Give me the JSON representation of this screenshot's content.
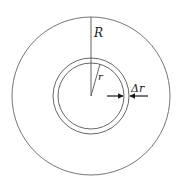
{
  "diagram": {
    "labels": {
      "outer_radius": "R",
      "inner_radius": "r",
      "thickness": "Δr"
    },
    "geometry": {
      "center": [
        91,
        96
      ],
      "outer_circle_radius": 79,
      "annulus_outer_radius": 38,
      "annulus_inner_radius": 33
    },
    "colors": {
      "stroke": "#555555",
      "arrow": "#1a1a1a",
      "background": "#ffffff"
    }
  }
}
